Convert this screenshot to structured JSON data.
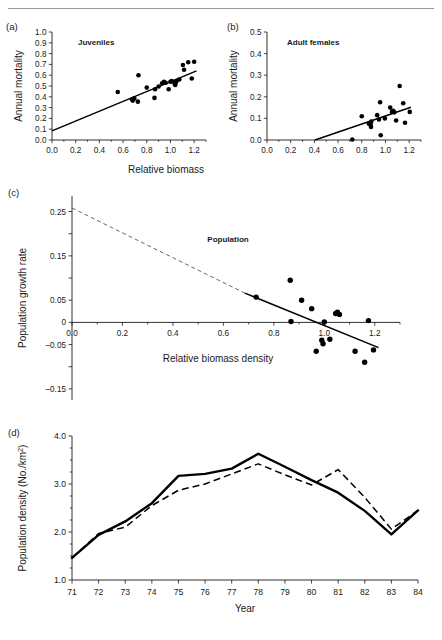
{
  "figure": {
    "panels": [
      "a",
      "b",
      "c",
      "d"
    ],
    "shared_xlabel_ab": "Relative biomass"
  },
  "panel_a": {
    "letter": "(a)",
    "series_label": "Juveniles"
  },
  "panel_b": {
    "letter": "(b)",
    "series_label": "Adult females"
  },
  "panel_c": {
    "letter": "(c)",
    "series_label": "Population"
  },
  "panel_d": {
    "letter": "(d)"
  },
  "chart_data": [
    {
      "type": "scatter",
      "panel": "a",
      "title": "Juveniles",
      "xlabel": "Relative biomass",
      "ylabel": "Annual mortality",
      "xlim": [
        0.0,
        1.3
      ],
      "ylim": [
        0.0,
        1.0
      ],
      "xticks": [
        0.0,
        0.2,
        0.4,
        0.6,
        0.8,
        1.0,
        1.2
      ],
      "xtick_labels": [
        "0.0",
        "0.2",
        "0.4",
        "0.6",
        "0.8",
        "1.0",
        "1.2"
      ],
      "yticks": [
        0.0,
        0.1,
        0.2,
        0.3,
        0.4,
        0.5,
        0.6,
        0.7,
        0.8,
        0.9,
        1.0
      ],
      "ytick_labels": [
        "0.0",
        "0.1",
        "0.2",
        "0.3",
        "0.4",
        "0.5",
        "0.6",
        "0.7",
        "0.8",
        "0.9",
        "1.0"
      ],
      "grid": false,
      "points": [
        [
          0.555,
          0.445
        ],
        [
          0.675,
          0.375
        ],
        [
          0.682,
          0.365
        ],
        [
          0.695,
          0.385
        ],
        [
          0.725,
          0.355
        ],
        [
          0.73,
          0.6
        ],
        [
          0.8,
          0.485
        ],
        [
          0.865,
          0.39
        ],
        [
          0.87,
          0.47
        ],
        [
          0.9,
          0.495
        ],
        [
          0.93,
          0.525
        ],
        [
          0.945,
          0.54
        ],
        [
          0.96,
          0.53
        ],
        [
          0.985,
          0.47
        ],
        [
          1.0,
          0.54
        ],
        [
          1.01,
          0.545
        ],
        [
          1.035,
          0.52
        ],
        [
          1.04,
          0.51
        ],
        [
          1.045,
          0.53
        ],
        [
          1.05,
          0.545
        ],
        [
          1.075,
          0.56
        ],
        [
          1.105,
          0.695
        ],
        [
          1.115,
          0.65
        ],
        [
          1.15,
          0.72
        ],
        [
          1.18,
          0.57
        ],
        [
          1.2,
          0.725
        ]
      ],
      "fit_line": {
        "x0": 0.0,
        "y0": 0.085,
        "x1": 1.22,
        "y1": 0.64
      }
    },
    {
      "type": "scatter",
      "panel": "b",
      "title": "Adult females",
      "xlabel": "Relative biomass",
      "ylabel": "Annual mortality",
      "xlim": [
        0.0,
        1.3
      ],
      "ylim": [
        0.0,
        0.5
      ],
      "xticks": [
        0.0,
        0.2,
        0.4,
        0.6,
        0.8,
        1.0,
        1.2
      ],
      "xtick_labels": [
        "0.0",
        "0.2",
        "0.4",
        "0.6",
        "0.8",
        "1.0",
        "1.2"
      ],
      "yticks": [
        0.0,
        0.1,
        0.2,
        0.3,
        0.4,
        0.5
      ],
      "ytick_labels": [
        "0.0",
        "0.1",
        "0.2",
        "0.3",
        "0.4",
        "0.5"
      ],
      "grid": false,
      "points": [
        [
          0.72,
          0.002
        ],
        [
          0.8,
          0.11
        ],
        [
          0.86,
          0.075
        ],
        [
          0.875,
          0.07
        ],
        [
          0.878,
          0.06
        ],
        [
          0.88,
          0.085
        ],
        [
          0.93,
          0.115
        ],
        [
          0.945,
          0.095
        ],
        [
          0.955,
          0.175
        ],
        [
          0.96,
          0.022
        ],
        [
          0.995,
          0.1
        ],
        [
          1.04,
          0.15
        ],
        [
          1.055,
          0.13
        ],
        [
          1.065,
          0.135
        ],
        [
          1.075,
          0.128
        ],
        [
          1.09,
          0.09
        ],
        [
          1.12,
          0.25
        ],
        [
          1.15,
          0.17
        ],
        [
          1.165,
          0.08
        ],
        [
          1.205,
          0.13
        ]
      ],
      "fit_line": {
        "x0": 0.405,
        "y0": 0.0,
        "x1": 1.215,
        "y1": 0.152
      }
    },
    {
      "type": "scatter",
      "panel": "c",
      "title": "Population",
      "xlabel": "Relative biomass density",
      "ylabel": "Population growth rate",
      "xlim": [
        0.0,
        1.3
      ],
      "ylim": [
        -0.175,
        0.285
      ],
      "xticks": [
        0.0,
        0.2,
        0.4,
        0.6,
        0.8,
        1.0,
        1.2
      ],
      "xtick_labels": [
        "0.0",
        "0.2",
        "0.4",
        "0.6",
        "0.8",
        "1.0",
        "1.2"
      ],
      "yticks": [
        -0.15,
        -0.1,
        -0.05,
        0.0,
        0.05,
        0.1,
        0.15,
        0.2,
        0.25
      ],
      "ytick_labels": [
        "–0.15",
        "",
        "–0.05",
        "0",
        "0.05",
        "",
        "0.15",
        "",
        "0.25"
      ],
      "grid": false,
      "points": [
        [
          0.73,
          0.057
        ],
        [
          0.865,
          0.095
        ],
        [
          0.868,
          0.002
        ],
        [
          0.91,
          0.05
        ],
        [
          0.95,
          0.031
        ],
        [
          0.968,
          -0.065
        ],
        [
          0.99,
          -0.04
        ],
        [
          0.995,
          -0.048
        ],
        [
          1.0,
          0.001
        ],
        [
          1.022,
          -0.038
        ],
        [
          1.045,
          0.02
        ],
        [
          1.052,
          0.023
        ],
        [
          1.06,
          0.018
        ],
        [
          1.122,
          -0.065
        ],
        [
          1.16,
          -0.09
        ],
        [
          1.175,
          0.004
        ],
        [
          1.195,
          -0.062
        ]
      ],
      "fit_line": {
        "x0": 0.685,
        "y0": 0.066,
        "x1": 1.215,
        "y1": -0.057
      },
      "extrapolation_line": {
        "x0": 0.0,
        "y0": 0.258,
        "x1": 0.685,
        "y1": 0.066,
        "style": "dashed"
      }
    },
    {
      "type": "line",
      "panel": "d",
      "xlabel": "Year",
      "ylabel": "Population density (No./km²)",
      "xlim": [
        70.6,
        84.4
      ],
      "ylim": [
        1.0,
        4.0
      ],
      "categories": [
        "71",
        "72",
        "73",
        "74",
        "75",
        "76",
        "77",
        "78",
        "79",
        "80",
        "81",
        "82",
        "83",
        "84"
      ],
      "yticks": [
        1.0,
        2.0,
        3.0,
        4.0
      ],
      "ytick_labels": [
        "1.0",
        "2.0",
        "3.0",
        "4.0"
      ],
      "grid": false,
      "series": [
        {
          "name": "observed",
          "style": "solid",
          "values": [
            1.46,
            1.94,
            2.22,
            2.6,
            3.17,
            3.21,
            3.32,
            3.63,
            3.36,
            3.08,
            2.82,
            2.44,
            1.95,
            2.45
          ]
        },
        {
          "name": "predicted",
          "style": "dashed",
          "values": [
            1.46,
            1.97,
            2.1,
            2.55,
            2.87,
            3.0,
            3.21,
            3.42,
            3.19,
            2.98,
            3.3,
            2.72,
            2.06,
            2.45
          ]
        }
      ]
    }
  ]
}
